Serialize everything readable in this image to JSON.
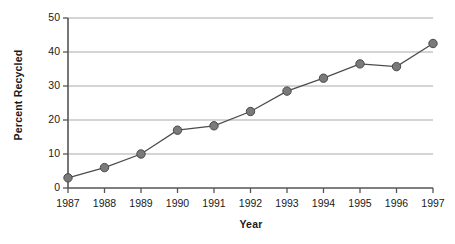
{
  "chart_data": {
    "type": "line",
    "title": "",
    "xlabel": "Year",
    "ylabel": "Percent Recycled",
    "categories": [
      "1987",
      "1988",
      "1989",
      "1990",
      "1991",
      "1992",
      "1993",
      "1994",
      "1995",
      "1996",
      "1997"
    ],
    "x": [
      1987,
      1988,
      1989,
      1990,
      1991,
      1992,
      1993,
      1994,
      1995,
      1996,
      1997
    ],
    "values": [
      3.0,
      6.0,
      10.0,
      17.0,
      18.3,
      22.5,
      28.5,
      32.3,
      36.5,
      35.7,
      42.5
    ],
    "series": [
      {
        "name": "Percent Recycled",
        "values": [
          3.0,
          6.0,
          10.0,
          17.0,
          18.3,
          22.5,
          28.5,
          32.3,
          36.5,
          35.7,
          42.5
        ]
      }
    ],
    "ylim": [
      0,
      50
    ],
    "yticks": [
      0,
      10,
      20,
      30,
      40,
      50
    ],
    "ytick_labels": [
      "0",
      "10",
      "20",
      "30",
      "40",
      "50"
    ],
    "grid": "horizontal",
    "legend": "none",
    "marker": "circle",
    "colors": {
      "line": "#4d4d4d",
      "marker_fill": "#7a7a7a",
      "marker_edge": "#4a4a4a",
      "gridline": "#a9a9a9",
      "axis": "#555555",
      "text": "#1a1a1a",
      "background": "#ffffff"
    }
  },
  "axes": {
    "y_title": "Percent Recycled",
    "x_title": "Year"
  }
}
